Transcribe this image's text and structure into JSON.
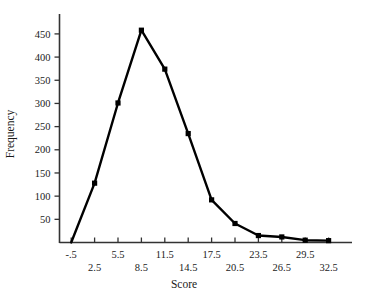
{
  "chart_data": {
    "type": "line",
    "title": "",
    "xlabel": "Score",
    "ylabel": "Frequency",
    "grid": false,
    "legend": "none",
    "marker": "filled-square",
    "line_color": "#000000",
    "categories": [
      "-.5",
      "2.5",
      "5.5",
      "8.5",
      "11.5",
      "14.5",
      "17.5",
      "20.5",
      "23.5",
      "26.5",
      "29.5",
      "32.5"
    ],
    "x": [
      -0.5,
      2.5,
      5.5,
      8.5,
      11.5,
      14.5,
      17.5,
      20.5,
      23.5,
      26.5,
      29.5,
      32.5
    ],
    "values": [
      0,
      128,
      301,
      458,
      374,
      235,
      92,
      41,
      15,
      12,
      5,
      4
    ],
    "xlim": [
      -2.0,
      35.5
    ],
    "ylim": [
      0,
      480
    ],
    "ytick_labels": [
      "50",
      "100",
      "150",
      "200",
      "250",
      "300",
      "350",
      "400",
      "450"
    ],
    "ytick_values": [
      50,
      100,
      150,
      200,
      250,
      300,
      350,
      400,
      450
    ],
    "xtick_labels_upper": [
      "-.5",
      "5.5",
      "11.5",
      "17.5",
      "23.5",
      "29.5"
    ],
    "xtick_labels_lower": [
      "2.5",
      "8.5",
      "14.5",
      "20.5",
      "26.5",
      "32.5"
    ]
  },
  "axes": {
    "y_title": "Frequency",
    "x_title": "Score"
  },
  "ticks": {
    "y": [
      {
        "label": "450",
        "value": 450
      },
      {
        "label": "400",
        "value": 400
      },
      {
        "label": "350",
        "value": 350
      },
      {
        "label": "300",
        "value": 300
      },
      {
        "label": "250",
        "value": 250
      },
      {
        "label": "200",
        "value": 200
      },
      {
        "label": "150",
        "value": 150
      },
      {
        "label": "100",
        "value": 100
      },
      {
        "label": "50",
        "value": 50
      }
    ],
    "x": [
      {
        "label": "-.5",
        "value": -0.5,
        "row": "upper"
      },
      {
        "label": "2.5",
        "value": 2.5,
        "row": "lower"
      },
      {
        "label": "5.5",
        "value": 5.5,
        "row": "upper"
      },
      {
        "label": "8.5",
        "value": 8.5,
        "row": "lower"
      },
      {
        "label": "11.5",
        "value": 11.5,
        "row": "upper"
      },
      {
        "label": "14.5",
        "value": 14.5,
        "row": "lower"
      },
      {
        "label": "17.5",
        "value": 17.5,
        "row": "upper"
      },
      {
        "label": "20.5",
        "value": 20.5,
        "row": "lower"
      },
      {
        "label": "23.5",
        "value": 23.5,
        "row": "upper"
      },
      {
        "label": "26.5",
        "value": 26.5,
        "row": "lower"
      },
      {
        "label": "29.5",
        "value": 29.5,
        "row": "upper"
      },
      {
        "label": "32.5",
        "value": 32.5,
        "row": "lower"
      }
    ]
  },
  "colors": {
    "line": "#000000",
    "axis": "#333333",
    "text": "#1a1a1a",
    "background": "#ffffff"
  }
}
